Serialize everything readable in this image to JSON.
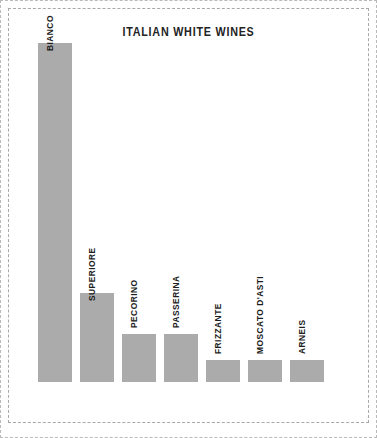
{
  "chart_data": {
    "type": "bar",
    "title": "ITALIAN WHITE WINES",
    "xlabel": "",
    "ylabel": "",
    "grid": false,
    "legend": false,
    "orientation": "vertical",
    "bar_color": "#ababab",
    "label_rotation": -90,
    "ylim": [
      0,
      100
    ],
    "categories": [
      "BIANCO",
      "SUPERIORE",
      "PECORINO",
      "PASSERINA",
      "FRIZZANTE",
      "MOSCATO D'ASTI",
      "ARNEIS"
    ],
    "values": [
      100,
      26.3,
      14.2,
      14.2,
      6.5,
      6.5,
      6.5
    ],
    "label_placement": [
      "inside",
      "inside",
      "outside",
      "outside",
      "outside",
      "outside",
      "outside"
    ]
  },
  "figure": {
    "background": "#ffffff",
    "frame_color": "#b0b0b0",
    "title_color": "#232323"
  }
}
